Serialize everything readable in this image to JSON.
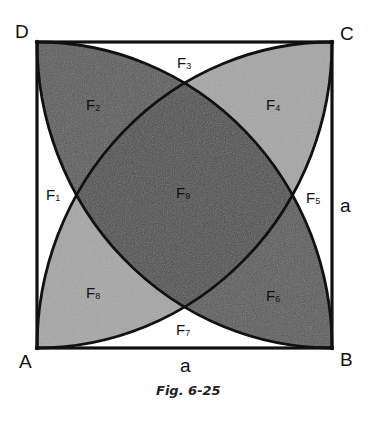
{
  "figure": {
    "caption": "Fig. 6-25",
    "corners": {
      "A": "A",
      "B": "B",
      "C": "C",
      "D": "D"
    },
    "side_labels": {
      "bottom": "a",
      "right": "a"
    },
    "regions": [
      {
        "id": "F1",
        "letter": "F",
        "sub": "1"
      },
      {
        "id": "F2",
        "letter": "F",
        "sub": "2"
      },
      {
        "id": "F3",
        "letter": "F",
        "sub": "3"
      },
      {
        "id": "F4",
        "letter": "F",
        "sub": "4"
      },
      {
        "id": "F5",
        "letter": "F",
        "sub": "5"
      },
      {
        "id": "F6",
        "letter": "F",
        "sub": "6"
      },
      {
        "id": "F7",
        "letter": "F",
        "sub": "7"
      },
      {
        "id": "F8",
        "letter": "F",
        "sub": "8"
      },
      {
        "id": "F9",
        "letter": "F",
        "sub": "9"
      }
    ],
    "colors": {
      "dark_fill": "#5a5a5a",
      "light_fill": "#a6a6a6",
      "center_fill": "#4e4e4e",
      "stroke": "#111111"
    }
  }
}
